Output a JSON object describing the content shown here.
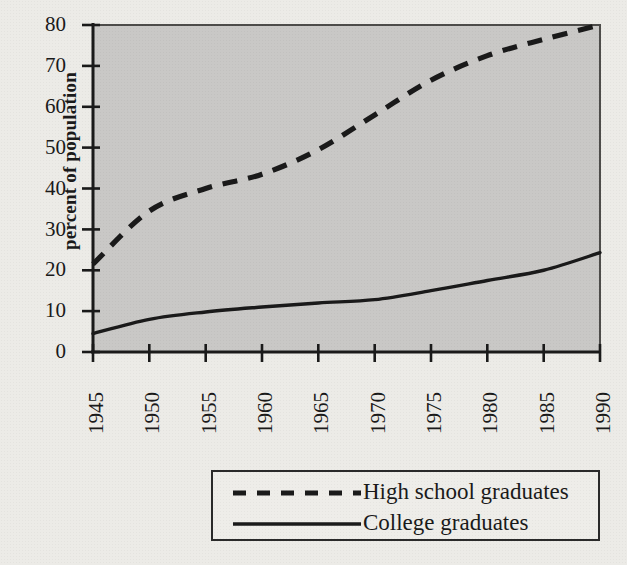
{
  "chart_data": {
    "type": "line",
    "title": "",
    "xlabel": "",
    "ylabel": "percent of population",
    "xlim": [
      1945,
      1990
    ],
    "ylim": [
      0,
      80
    ],
    "grid": false,
    "legend_position": "below-center",
    "x_ticks": [
      "1945",
      "1950",
      "1955",
      "1960",
      "1965",
      "1970",
      "1975",
      "1980",
      "1985",
      "1990"
    ],
    "y_ticks": [
      "0",
      "10",
      "20",
      "30",
      "40",
      "50",
      "60",
      "70",
      "80"
    ],
    "x": [
      1945,
      1950,
      1955,
      1960,
      1965,
      1970,
      1975,
      1980,
      1985,
      1990
    ],
    "series": [
      {
        "name": "High school graduates",
        "style": "dashed",
        "color": "#1a1a1a",
        "values": [
          21.5,
          34.5,
          40.0,
          43.5,
          49.5,
          58.0,
          66.5,
          72.5,
          76.5,
          80.0
        ]
      },
      {
        "name": "College graduates",
        "style": "solid",
        "color": "#1a1a1a",
        "values": [
          4.5,
          8.0,
          9.8,
          11.0,
          12.0,
          12.8,
          15.0,
          17.5,
          20.0,
          24.3
        ]
      }
    ]
  },
  "axes": {
    "y_title": "percent of population",
    "y_tick_labels": [
      "80",
      "70",
      "60",
      "50",
      "40",
      "30",
      "20",
      "10",
      "0"
    ],
    "x_tick_labels": [
      "1945",
      "1950",
      "1955",
      "1960",
      "1965",
      "1970",
      "1975",
      "1980",
      "1985",
      "1990"
    ]
  },
  "legend": {
    "entries": [
      {
        "label": "High school graduates",
        "style": "dashed"
      },
      {
        "label": "College graduates",
        "style": "solid"
      }
    ]
  },
  "colors": {
    "page_background": "#ecebe7",
    "plot_fill": "#c9c8c6",
    "axis": "#1a1a1a",
    "line": "#1a1a1a"
  }
}
